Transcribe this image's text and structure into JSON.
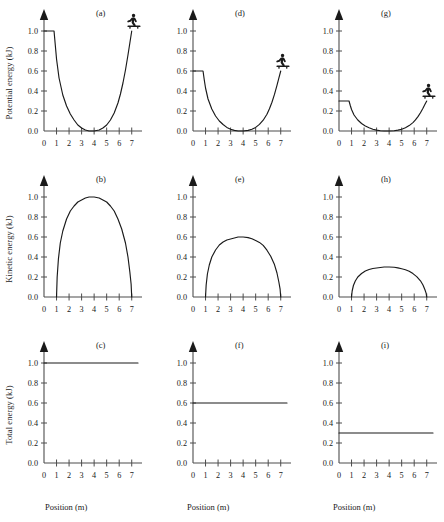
{
  "figure": {
    "axis_titles": {
      "y_potential": "Potential energy (kJ)",
      "y_kinetic": "Kinetic energy (kJ)",
      "y_total": "Total energy (kJ)",
      "x": "Position (m)"
    },
    "panel_tags": {
      "a": "(a)",
      "b": "(b)",
      "c": "(c)",
      "d": "(d)",
      "e": "(e)",
      "f": "(f)",
      "g": "(g)",
      "h": "(h)",
      "i": "(i)"
    },
    "ytick_labels": [
      "0.0",
      "0.2",
      "0.4",
      "0.6",
      "0.8",
      "1.0"
    ],
    "xtick_labels": [
      "0",
      "1",
      "2",
      "3",
      "4",
      "5",
      "6",
      "7"
    ],
    "icon_names": {
      "skater": "skateboarder-icon",
      "axis_arrow": "axis-arrow-icon"
    },
    "colors": {
      "curve": "#1a1a1a",
      "axis": "#4d4d4d",
      "background": "#ffffff"
    }
  },
  "chart_data": [
    {
      "type": "line",
      "panel": "(a)",
      "title": "",
      "xlabel": "Position (m)",
      "ylabel": "Potential energy (kJ)",
      "xlim": [
        0,
        7.5
      ],
      "ylim": [
        0,
        1.1
      ],
      "xticks": [
        0,
        1,
        2,
        3,
        4,
        5,
        6,
        7
      ],
      "yticks": [
        0.0,
        0.2,
        0.4,
        0.6,
        0.8,
        1.0
      ],
      "grid": false,
      "legend": null,
      "total_energy": 1.0,
      "annotations": [
        "skateboarder at x=7, y=1.0"
      ],
      "x": [
        0.0,
        0.4,
        0.8,
        0.9,
        1.0,
        1.2,
        1.5,
        1.8,
        2.1,
        2.4,
        2.7,
        3.0,
        3.3,
        3.6,
        4.0,
        4.4,
        4.7,
        5.0,
        5.3,
        5.6,
        5.9,
        6.1,
        6.3,
        6.5,
        6.7,
        6.85,
        7.0
      ],
      "y": [
        1.0,
        1.0,
        1.0,
        0.86,
        0.72,
        0.53,
        0.36,
        0.25,
        0.17,
        0.11,
        0.06,
        0.03,
        0.01,
        0.0,
        0.0,
        0.01,
        0.03,
        0.06,
        0.11,
        0.18,
        0.28,
        0.37,
        0.48,
        0.61,
        0.76,
        0.88,
        1.0
      ]
    },
    {
      "type": "line",
      "panel": "(b)",
      "title": "",
      "xlabel": "Position (m)",
      "ylabel": "Kinetic energy (kJ)",
      "xlim": [
        0,
        7.5
      ],
      "ylim": [
        0,
        1.1
      ],
      "xticks": [
        0,
        1,
        2,
        3,
        4,
        5,
        6,
        7
      ],
      "yticks": [
        0.0,
        0.2,
        0.4,
        0.6,
        0.8,
        1.0
      ],
      "grid": false,
      "legend": null,
      "total_energy": 1.0,
      "annotations": [],
      "x": [
        1.0,
        1.05,
        1.15,
        1.3,
        1.5,
        1.8,
        2.1,
        2.4,
        2.7,
        3.0,
        3.3,
        3.6,
        4.0,
        4.4,
        4.7,
        5.0,
        5.3,
        5.6,
        5.9,
        6.2,
        6.5,
        6.7,
        6.85,
        6.95,
        7.0
      ],
      "y": [
        0.0,
        0.2,
        0.38,
        0.54,
        0.66,
        0.78,
        0.86,
        0.91,
        0.95,
        0.97,
        0.99,
        1.0,
        1.0,
        0.99,
        0.97,
        0.95,
        0.91,
        0.86,
        0.78,
        0.68,
        0.54,
        0.4,
        0.25,
        0.13,
        0.0
      ]
    },
    {
      "type": "line",
      "panel": "(c)",
      "title": "",
      "xlabel": "Position (m)",
      "ylabel": "Total energy (kJ)",
      "xlim": [
        0,
        7.5
      ],
      "ylim": [
        0,
        1.1
      ],
      "xticks": [
        0,
        1,
        2,
        3,
        4,
        5,
        6,
        7
      ],
      "yticks": [
        0.0,
        0.2,
        0.4,
        0.6,
        0.8,
        1.0
      ],
      "grid": false,
      "legend": null,
      "total_energy": 1.0,
      "annotations": [
        "constant total energy 1.0 kJ"
      ],
      "x": [
        0.0,
        7.5
      ],
      "y": [
        1.0,
        1.0
      ]
    },
    {
      "type": "line",
      "panel": "(d)",
      "title": "",
      "xlabel": "Position (m)",
      "ylabel": "Potential energy (kJ)",
      "xlim": [
        0,
        7.5
      ],
      "ylim": [
        0,
        1.1
      ],
      "xticks": [
        0,
        1,
        2,
        3,
        4,
        5,
        6,
        7
      ],
      "yticks": [
        0.0,
        0.2,
        0.4,
        0.6,
        0.8,
        1.0
      ],
      "grid": false,
      "legend": null,
      "total_energy": 0.6,
      "annotations": [
        "skateboarder at x=7, y=0.6"
      ],
      "x": [
        0.0,
        0.4,
        0.8,
        0.9,
        1.0,
        1.2,
        1.5,
        1.8,
        2.1,
        2.4,
        2.7,
        3.0,
        3.3,
        3.6,
        4.0,
        4.4,
        4.7,
        5.0,
        5.3,
        5.6,
        5.9,
        6.1,
        6.3,
        6.5,
        6.7,
        6.85,
        7.0
      ],
      "y": [
        0.6,
        0.6,
        0.6,
        0.51,
        0.43,
        0.32,
        0.22,
        0.15,
        0.1,
        0.065,
        0.036,
        0.018,
        0.006,
        0.0,
        0.0,
        0.006,
        0.018,
        0.036,
        0.066,
        0.108,
        0.168,
        0.222,
        0.288,
        0.366,
        0.456,
        0.528,
        0.6
      ]
    },
    {
      "type": "line",
      "panel": "(e)",
      "title": "",
      "xlabel": "Position (m)",
      "ylabel": "Kinetic energy (kJ)",
      "xlim": [
        0,
        7.5
      ],
      "ylim": [
        0,
        1.1
      ],
      "xticks": [
        0,
        1,
        2,
        3,
        4,
        5,
        6,
        7
      ],
      "yticks": [
        0.0,
        0.2,
        0.4,
        0.6,
        0.8,
        1.0
      ],
      "grid": false,
      "legend": null,
      "total_energy": 0.6,
      "annotations": [],
      "x": [
        1.0,
        1.05,
        1.15,
        1.3,
        1.5,
        1.8,
        2.1,
        2.4,
        2.7,
        3.0,
        3.3,
        3.6,
        4.0,
        4.4,
        4.7,
        5.0,
        5.3,
        5.6,
        5.9,
        6.2,
        6.5,
        6.7,
        6.85,
        6.95,
        7.0
      ],
      "y": [
        0.0,
        0.12,
        0.23,
        0.32,
        0.4,
        0.47,
        0.52,
        0.55,
        0.57,
        0.58,
        0.59,
        0.6,
        0.6,
        0.594,
        0.582,
        0.564,
        0.546,
        0.516,
        0.468,
        0.408,
        0.324,
        0.24,
        0.15,
        0.078,
        0.0
      ]
    },
    {
      "type": "line",
      "panel": "(f)",
      "title": "",
      "xlabel": "Position (m)",
      "ylabel": "Total energy (kJ)",
      "xlim": [
        0,
        7.5
      ],
      "ylim": [
        0,
        1.1
      ],
      "xticks": [
        0,
        1,
        2,
        3,
        4,
        5,
        6,
        7
      ],
      "yticks": [
        0.0,
        0.2,
        0.4,
        0.6,
        0.8,
        1.0
      ],
      "grid": false,
      "legend": null,
      "total_energy": 0.6,
      "annotations": [
        "constant total energy 0.6 kJ"
      ],
      "x": [
        0.0,
        7.5
      ],
      "y": [
        0.6,
        0.6
      ]
    },
    {
      "type": "line",
      "panel": "(g)",
      "title": "",
      "xlabel": "Position (m)",
      "ylabel": "Potential energy (kJ)",
      "xlim": [
        0,
        7.5
      ],
      "ylim": [
        0,
        1.1
      ],
      "xticks": [
        0,
        1,
        2,
        3,
        4,
        5,
        6,
        7
      ],
      "yticks": [
        0.0,
        0.2,
        0.4,
        0.6,
        0.8,
        1.0
      ],
      "grid": false,
      "legend": null,
      "total_energy": 0.3,
      "annotations": [
        "skateboarder at x=7, y=0.3"
      ],
      "x": [
        0.0,
        0.4,
        0.8,
        0.9,
        1.0,
        1.2,
        1.5,
        1.8,
        2.1,
        2.4,
        2.7,
        3.0,
        3.3,
        3.6,
        4.0,
        4.4,
        4.7,
        5.0,
        5.3,
        5.6,
        5.9,
        6.1,
        6.3,
        6.5,
        6.7,
        6.85,
        7.0
      ],
      "y": [
        0.3,
        0.3,
        0.3,
        0.255,
        0.215,
        0.16,
        0.11,
        0.075,
        0.05,
        0.033,
        0.018,
        0.009,
        0.003,
        0.0,
        0.0,
        0.003,
        0.009,
        0.018,
        0.033,
        0.054,
        0.084,
        0.111,
        0.144,
        0.183,
        0.228,
        0.264,
        0.3
      ]
    },
    {
      "type": "line",
      "panel": "(h)",
      "title": "",
      "xlabel": "Position (m)",
      "ylabel": "Kinetic energy (kJ)",
      "xlim": [
        0,
        7.5
      ],
      "ylim": [
        0,
        1.1
      ],
      "xticks": [
        0,
        1,
        2,
        3,
        4,
        5,
        6,
        7
      ],
      "yticks": [
        0.0,
        0.2,
        0.4,
        0.6,
        0.8,
        1.0
      ],
      "grid": false,
      "legend": null,
      "total_energy": 0.3,
      "annotations": [],
      "x": [
        1.0,
        1.05,
        1.15,
        1.3,
        1.5,
        1.8,
        2.1,
        2.4,
        2.7,
        3.0,
        3.3,
        3.6,
        4.0,
        4.4,
        4.7,
        5.0,
        5.3,
        5.6,
        5.9,
        6.2,
        6.5,
        6.7,
        6.85,
        6.95,
        7.0
      ],
      "y": [
        0.0,
        0.06,
        0.115,
        0.16,
        0.2,
        0.235,
        0.26,
        0.275,
        0.285,
        0.29,
        0.295,
        0.3,
        0.3,
        0.297,
        0.291,
        0.282,
        0.273,
        0.258,
        0.234,
        0.204,
        0.162,
        0.12,
        0.075,
        0.039,
        0.0
      ]
    },
    {
      "type": "line",
      "panel": "(i)",
      "title": "",
      "xlabel": "Position (m)",
      "ylabel": "Total energy (kJ)",
      "xlim": [
        0,
        7.5
      ],
      "ylim": [
        0,
        1.1
      ],
      "xticks": [
        0,
        1,
        2,
        3,
        4,
        5,
        6,
        7
      ],
      "yticks": [
        0.0,
        0.2,
        0.4,
        0.6,
        0.8,
        1.0
      ],
      "grid": false,
      "legend": null,
      "total_energy": 0.3,
      "annotations": [
        "constant total energy 0.3 kJ"
      ],
      "x": [
        0.0,
        7.5
      ],
      "y": [
        0.3,
        0.3
      ]
    }
  ]
}
